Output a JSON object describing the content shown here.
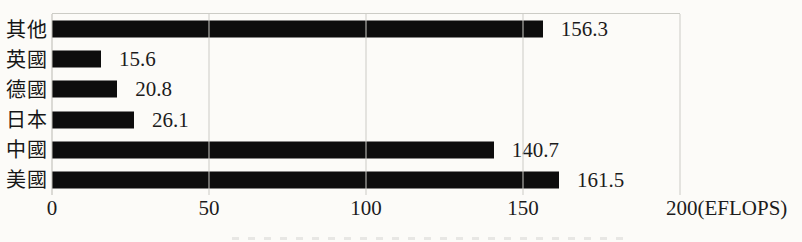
{
  "chart_data": {
    "type": "bar",
    "orientation": "horizontal",
    "title": "",
    "xlabel": "",
    "ylabel": "",
    "categories_top_to_bottom": [
      "其他",
      "英國",
      "德國",
      "日本",
      "中國",
      "美國"
    ],
    "values_top_to_bottom": [
      156.3,
      15.6,
      20.8,
      26.1,
      140.7,
      161.5
    ],
    "value_labels_top_to_bottom": [
      "156.3",
      "15.6",
      "20.8",
      "26.1",
      "140.7",
      "161.5"
    ],
    "xlim": [
      0,
      200
    ],
    "x_ticks": [
      {
        "value": 0,
        "label": "0"
      },
      {
        "value": 50,
        "label": "50"
      },
      {
        "value": 100,
        "label": "100"
      },
      {
        "value": 150,
        "label": "150"
      },
      {
        "value": 200,
        "label": "200(EFLOPS)"
      }
    ],
    "unit": "EFLOPS",
    "grid": "vertical-light",
    "legend": "none",
    "colors": {
      "bar": "#0d0d0d",
      "background": "#fcfbf8",
      "gridline": "#ccccc6",
      "text": "#1c1c1c"
    }
  }
}
